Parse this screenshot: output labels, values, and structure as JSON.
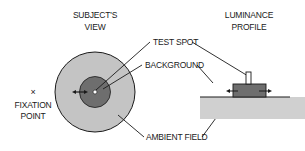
{
  "diagram": {
    "headings": {
      "subjects_view_line1": "SUBJECT'S",
      "subjects_view_line2": "VIEW",
      "luminance_profile_line1": "LUMINANCE",
      "luminance_profile_line2": "PROFILE"
    },
    "labels": {
      "fixation_marker": "×",
      "fixation_line1": "FIXATION",
      "fixation_line2": "POINT",
      "test_spot": "TEST SPOT",
      "background": "BACKGROUND",
      "ambient_field": "AMBIENT FIELD"
    },
    "colors": {
      "ambient": "#c4c4c4",
      "background": "#6e6e6e",
      "test_spot": "#ffffff",
      "stroke": "#1a1a1a"
    }
  }
}
